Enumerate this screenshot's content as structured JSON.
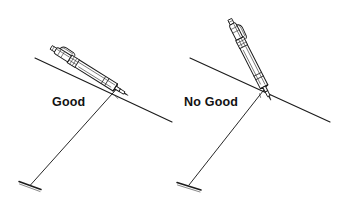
{
  "figure": {
    "background_color": "#ffffff",
    "ink_color": "#1b1b1b",
    "label_color": "#121212",
    "width": 337,
    "height": 204
  },
  "panels": [
    {
      "id": "good",
      "label": "Good",
      "verdict": "correct",
      "pencil": {
        "name": "mechanical-pencil",
        "angle_description": "shallow, leaning to the right",
        "tip_x": 117,
        "tip_y": 88
      },
      "lines": {
        "ruling_line": {
          "x1": 35,
          "y1": 58,
          "x2": 172,
          "y2": 122
        },
        "trace_line": {
          "x1": 117,
          "y1": 88,
          "x2": 30,
          "y2": 186
        },
        "foot_mark": {
          "x1": 20,
          "y1": 182,
          "x2": 42,
          "y2": 190
        }
      }
    },
    {
      "id": "no-good",
      "label": "No Good",
      "verdict": "incorrect",
      "pencil": {
        "name": "mechanical-pencil",
        "angle_description": "steep, nearly vertical",
        "tip_x": 265,
        "tip_y": 88
      },
      "lines": {
        "ruling_line": {
          "x1": 190,
          "y1": 58,
          "x2": 330,
          "y2": 122
        },
        "trace_line": {
          "x1": 265,
          "y1": 88,
          "x2": 188,
          "y2": 186
        },
        "foot_mark": {
          "x1": 178,
          "y1": 183,
          "x2": 202,
          "y2": 190
        }
      }
    }
  ]
}
